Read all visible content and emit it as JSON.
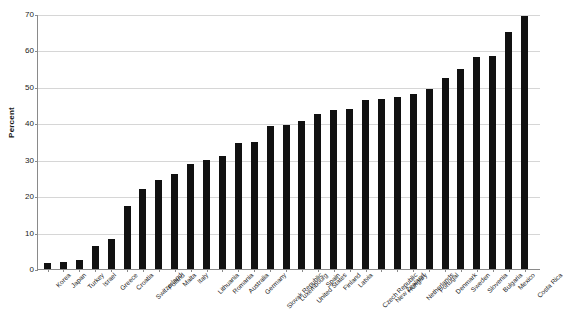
{
  "chart_data": {
    "type": "bar",
    "title": "",
    "subtitle": "",
    "xlabel": "",
    "ylabel": "Percent",
    "ylim": [
      0,
      70
    ],
    "yticks": [
      0,
      10,
      20,
      30,
      40,
      50,
      60,
      70
    ],
    "ytick_labels": [
      "0",
      "10",
      "20",
      "30",
      "40",
      "50",
      "60",
      "70"
    ],
    "grid": "horizontal",
    "legend": "none",
    "bar_color": "#111111",
    "grid_color": "#d6d6d6",
    "axis_color": "#8a8a8a",
    "categories": [
      "Korea",
      "Japan",
      "Turkey",
      "Israel",
      "Greece",
      "Croatia",
      "Switzerland",
      "Poland",
      "Malta",
      "Italy",
      "Lithuania",
      "Romania",
      "Australia",
      "Germany",
      "Slovak Republic",
      "Luxembourg",
      "United States",
      "Spain",
      "Finland",
      "Latvia",
      "Czech Republic",
      "New Zealand",
      "Hungary",
      "Netherlands",
      "Portugal",
      "Denmark",
      "Sweden",
      "Slovenia",
      "Bulgaria",
      "Mexico",
      "Costa Rica"
    ],
    "values": [
      1.6,
      2.0,
      2.4,
      6.3,
      8.2,
      17.4,
      22.0,
      24.5,
      26.2,
      28.8,
      30.0,
      31.0,
      34.6,
      35.0,
      39.3,
      39.5,
      40.5,
      42.5,
      43.7,
      44.0,
      46.5,
      46.8,
      47.3,
      48.0,
      49.3,
      52.3,
      54.8,
      58.3,
      58.6,
      65.0,
      69.5
    ]
  }
}
